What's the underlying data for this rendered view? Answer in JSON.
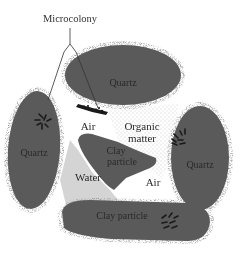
{
  "diagram": {
    "title_label": "Microcolony",
    "labels": {
      "quartz_top": "Quartz",
      "quartz_left": "Quartz",
      "quartz_right": "Quartz",
      "clay_center_line1": "Clay",
      "clay_center_line2": "particle",
      "clay_bottom": "Clay particle",
      "air_top": "Air",
      "air_right": "Air",
      "organic_line1": "Organic",
      "organic_line2": "matter",
      "water": "Water"
    },
    "colors": {
      "particle": "#5a5a5a",
      "water": "#d4d4d4",
      "organic_stipple": "#8a8a8a",
      "background": "#ffffff",
      "microbe": "#1a1a1a",
      "text": "#2a2a2a"
    }
  }
}
